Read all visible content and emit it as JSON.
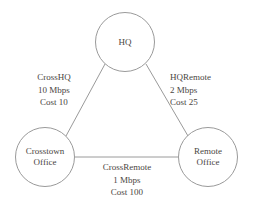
{
  "diagram": {
    "type": "network-topology",
    "title": "",
    "background_color": "#ffffff",
    "stroke_color": "#9a9a9a",
    "text_color": "#4a4642",
    "nodes": [
      {
        "id": "hq",
        "label_lines": [
          "HQ"
        ],
        "cx": 125,
        "cy": 42,
        "r": 30
      },
      {
        "id": "crosstown",
        "label_lines": [
          "Crosstown",
          "Office"
        ],
        "cx": 45,
        "cy": 157,
        "r": 30
      },
      {
        "id": "remote",
        "label_lines": [
          "Remote",
          "Office"
        ],
        "cx": 208,
        "cy": 157,
        "r": 30
      }
    ],
    "links": [
      {
        "id": "crosshq",
        "from": "crosstown",
        "to": "hq",
        "name": "CrossHQ",
        "bandwidth": "10 Mbps",
        "cost": "Cost 10"
      },
      {
        "id": "hqremote",
        "from": "hq",
        "to": "remote",
        "name": "HQRemote",
        "bandwidth": "2 Mbps",
        "cost": "Cost 25"
      },
      {
        "id": "crossremote",
        "from": "crosstown",
        "to": "remote",
        "name": "CrossRemote",
        "bandwidth": "1 Mbps",
        "cost": "Cost 100"
      }
    ]
  }
}
